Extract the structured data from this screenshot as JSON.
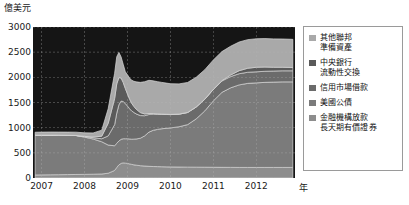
{
  "chart_data": {
    "type": "area",
    "stacked": true,
    "title": "",
    "subtitle": "",
    "xlabel": "年",
    "ylabel": "億美元",
    "ylim": [
      0,
      3000
    ],
    "xlim": [
      2006.8,
      2012.9
    ],
    "yticks": [
      0,
      500,
      1000,
      1500,
      2000,
      2500,
      3000
    ],
    "xticks": [
      2007,
      2008,
      2009,
      2010,
      2011,
      2012
    ],
    "grid": true,
    "grid_style": "dashed",
    "legend_position": "right",
    "x": [
      2006.85,
      2007.0,
      2007.2,
      2007.4,
      2007.6,
      2007.8,
      2008.0,
      2008.2,
      2008.4,
      2008.55,
      2008.7,
      2008.75,
      2008.8,
      2008.85,
      2008.9,
      2008.95,
      2009.0,
      2009.05,
      2009.1,
      2009.15,
      2009.2,
      2009.3,
      2009.4,
      2009.5,
      2009.6,
      2009.7,
      2009.8,
      2009.9,
      2010.0,
      2010.2,
      2010.4,
      2010.6,
      2010.8,
      2011.0,
      2011.2,
      2011.4,
      2011.6,
      2011.8,
      2012.0,
      2012.2,
      2012.4,
      2012.6,
      2012.85
    ],
    "series": [
      {
        "name": "金融機構放款長天期有價證券",
        "label_lines": [
          "金融機構放款",
          "長天期有價證券"
        ],
        "color": "#8d8d8d",
        "order": 1,
        "values": [
          60,
          62,
          64,
          66,
          68,
          70,
          72,
          75,
          80,
          95,
          150,
          210,
          260,
          290,
          300,
          295,
          290,
          280,
          270,
          262,
          255,
          245,
          238,
          232,
          228,
          226,
          224,
          222,
          220,
          218,
          216,
          215,
          214,
          213,
          212,
          211,
          210,
          210,
          210,
          210,
          210,
          210,
          210
        ]
      },
      {
        "name": "美國公債",
        "label_lines": [
          "美國公債"
        ],
        "color": "#7b7b7b",
        "order": 2,
        "values": [
          790,
          790,
          788,
          785,
          780,
          775,
          740,
          700,
          640,
          560,
          490,
          480,
          475,
          478,
          480,
          485,
          490,
          495,
          500,
          510,
          520,
          545,
          600,
          680,
          720,
          740,
          755,
          765,
          775,
          800,
          845,
          960,
          1120,
          1320,
          1490,
          1580,
          1640,
          1670,
          1680,
          1690,
          1695,
          1700,
          1700
        ]
      },
      {
        "name": "信用市場借款",
        "label_lines": [
          "信用市場借款"
        ],
        "color": "#6b6b6b",
        "order": 3,
        "values": [
          0,
          0,
          0,
          0,
          0,
          0,
          10,
          25,
          60,
          180,
          420,
          600,
          720,
          760,
          740,
          700,
          650,
          600,
          560,
          530,
          500,
          450,
          400,
          350,
          320,
          300,
          285,
          275,
          265,
          250,
          240,
          235,
          230,
          228,
          226,
          224,
          222,
          221,
          220,
          220,
          220,
          220,
          220
        ]
      },
      {
        "name": "中央銀行流動性交換",
        "label_lines": [
          "中央銀行",
          "流動性交換"
        ],
        "color": "#5a5a5a",
        "order": 4,
        "values": [
          0,
          0,
          0,
          0,
          0,
          0,
          5,
          15,
          50,
          250,
          520,
          580,
          540,
          460,
          380,
          300,
          240,
          190,
          150,
          120,
          95,
          60,
          35,
          20,
          12,
          8,
          5,
          4,
          3,
          2,
          2,
          2,
          3,
          5,
          8,
          30,
          60,
          80,
          90,
          85,
          75,
          70,
          65
        ]
      },
      {
        "name": "其他聯邦準備資產",
        "label_lines": [
          "其他聯邦",
          "準備資產"
        ],
        "color": "#a9a9a9",
        "order": 5,
        "values": [
          60,
          60,
          62,
          62,
          64,
          66,
          70,
          80,
          120,
          290,
          500,
          540,
          500,
          420,
          360,
          330,
          380,
          420,
          460,
          500,
          540,
          600,
          640,
          660,
          650,
          640,
          630,
          620,
          610,
          600,
          595,
          590,
          585,
          580,
          576,
          572,
          570,
          568,
          566,
          565,
          564,
          562,
          560
        ]
      }
    ],
    "totals_note": "總額由2007年約9000億美元上升至2012年約2900億美元級距"
  },
  "axis": {
    "y_unit_label": "億美元",
    "x_unit_label": "年",
    "y_tick_labels": [
      "3000",
      "2500",
      "2000",
      "1500",
      "1000",
      "500",
      "0"
    ],
    "x_tick_labels": [
      "2007",
      "2008",
      "2009",
      "2010",
      "2011",
      "2012"
    ]
  },
  "legend": {
    "items": [
      {
        "label": "其他聯邦\n準備資產",
        "color": "#a9a9a9",
        "name": "other-federal-reserve-assets"
      },
      {
        "label": "中央銀行\n流動性交換",
        "color": "#5a5a5a",
        "name": "central-bank-liquidity-swaps"
      },
      {
        "label": "信用市場借款",
        "color": "#6b6b6b",
        "name": "credit-market-borrowing"
      },
      {
        "label": "美國公債",
        "color": "#7b7b7b",
        "name": "us-treasury-securities"
      },
      {
        "label": "金融機構放款\n長天期有價證券",
        "color": "#8d8d8d",
        "name": "financial-institution-loans-long-term-securities"
      }
    ]
  },
  "colors": {
    "plot_background": "#151515",
    "grid": "#b9b9b9",
    "text": "#1a1a1a",
    "legend_border": "#9a9a9a",
    "page_background": "#ffffff"
  }
}
